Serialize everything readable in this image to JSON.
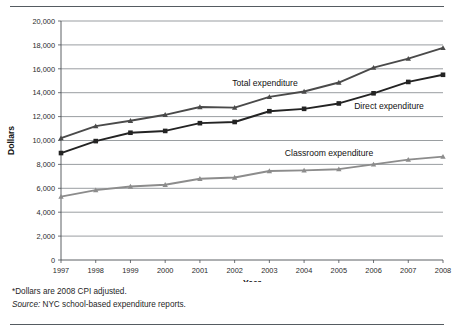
{
  "chart_data": {
    "type": "line",
    "title": "",
    "subtitle": "",
    "xlabel": "Year",
    "ylabel": "Dollars",
    "x": [
      1997,
      1998,
      1999,
      2000,
      2001,
      2002,
      2003,
      2004,
      2005,
      2006,
      2007,
      2008
    ],
    "xtick_labels": [
      "1997",
      "1998",
      "1999",
      "2000",
      "2001",
      "2002",
      "2003",
      "2004",
      "2005",
      "2006",
      "2007",
      "2008"
    ],
    "ytick_labels": [
      "0",
      "2,000",
      "4,000",
      "6,000",
      "8,000",
      "10,000",
      "12,000",
      "14,000",
      "16,000",
      "18,000",
      "20,000"
    ],
    "ytick_values": [
      0,
      2000,
      4000,
      6000,
      8000,
      10000,
      12000,
      14000,
      16000,
      18000,
      20000
    ],
    "ylim": [
      0,
      20000
    ],
    "xlim": [
      1997,
      2008
    ],
    "grid": true,
    "legend_position": "inline-annotations",
    "series": [
      {
        "name": "Total expenditure",
        "color": "#4a4a4a",
        "marker": "triangle",
        "values": [
          10200,
          11200,
          11650,
          12150,
          12800,
          12750,
          13650,
          14100,
          14850,
          16100,
          16850,
          17750
        ]
      },
      {
        "name": "Direct expenditure",
        "color": "#232323",
        "marker": "square",
        "values": [
          8950,
          9950,
          10650,
          10800,
          11450,
          11550,
          12450,
          12650,
          13100,
          13950,
          14900,
          15500
        ]
      },
      {
        "name": "Classroom expenditure",
        "color": "#8c8c8c",
        "marker": "triangle",
        "values": [
          5300,
          5850,
          6150,
          6300,
          6800,
          6900,
          7450,
          7500,
          7600,
          8000,
          8400,
          8650
        ]
      }
    ],
    "annotations": [
      {
        "text": "Total expenditure",
        "x_px": 265,
        "y_px": 86
      },
      {
        "text": "Direct expenditure",
        "x_px": 389,
        "y_px": 109
      },
      {
        "text": "Classroom expenditure",
        "x_px": 329,
        "y_px": 156
      }
    ]
  },
  "notes": {
    "footnote": "*Dollars are 2008 CPI adjusted.",
    "source_label": "Source:",
    "source_text": " NYC school-based expenditure reports."
  },
  "colors": {
    "total": "#4a4a4a",
    "direct": "#232323",
    "classroom": "#8c8c8c",
    "grid": "#6e7478",
    "axis": "#4a4f54",
    "rule": "#555b61"
  }
}
